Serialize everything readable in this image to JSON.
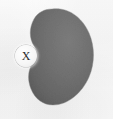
{
  "figure": {
    "canvas": {
      "width": 113,
      "height": 119
    },
    "background_color": "#fbfbfb",
    "caption": "",
    "shape": {
      "name": "kidney-blob",
      "description": "gray kidney-shaped region, concave on the left side",
      "fill_color": "#6e6e6e",
      "fill_color_dark": "#5e5e5e",
      "fill_color_light": "#7c7c7c",
      "edge_color": "#8a8a8a",
      "bounds": {
        "left": 26,
        "top": 8,
        "right": 94,
        "bottom": 106
      }
    },
    "labels": [
      {
        "name": "point-x",
        "text": "X",
        "position": {
          "x": 26,
          "y": 56
        },
        "marker_shape": "circle",
        "marker_fill": "#f7f7f7",
        "text_color": "#2a2a2a"
      }
    ]
  }
}
